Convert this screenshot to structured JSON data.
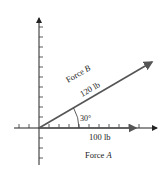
{
  "diagram": {
    "force_b_label": "Force B",
    "force_b_name": "Force ",
    "force_b_var": "B",
    "force_b_magnitude": "120 lb",
    "force_a_magnitude": "100 lb",
    "force_a_name": "Force ",
    "force_a_var": "A",
    "angle_label": "30°",
    "colors": {
      "axis": "#222222",
      "vector": "#555555",
      "text": "#222222"
    }
  }
}
